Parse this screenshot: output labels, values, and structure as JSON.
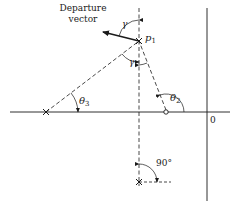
{
  "diagram": {
    "labels": {
      "departure_line1": "Departure",
      "departure_line2": "vector",
      "p1_main": "p",
      "p1_sub": "1",
      "gamma_top": "γ",
      "gamma_mid": "γ",
      "theta2_main": "θ",
      "theta2_sub": "2",
      "theta3_main": "θ",
      "theta3_sub": "3",
      "angle_90": "90°",
      "origin": "0"
    },
    "elements": {
      "poles": [
        {
          "name": "p1",
          "x": 139,
          "y": 41,
          "symbol": "×"
        },
        {
          "name": "left-pole",
          "x": 46,
          "y": 112,
          "symbol": "×"
        },
        {
          "name": "bottom-pole",
          "x": 139,
          "y": 182,
          "symbol": "×"
        }
      ],
      "zeros": [
        {
          "name": "zero",
          "x": 166,
          "y": 112,
          "symbol": "○"
        }
      ]
    },
    "colors": {
      "line": "#1a1a1a",
      "background": "#ffffff"
    }
  }
}
